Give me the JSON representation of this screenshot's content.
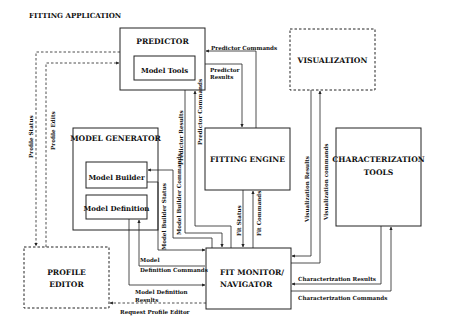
{
  "title": "FITTING APPLICATION",
  "boxes": {
    "predictor": {
      "label": "PREDICTOR",
      "style": "solid"
    },
    "model_tools": {
      "label": "Model Tools",
      "style": "solid"
    },
    "visualization": {
      "label": "VISUALIZATION",
      "style": "dashed"
    },
    "model_generator": {
      "label": "MODEL GENERATOR",
      "style": "solid"
    },
    "model_builder": {
      "label": "Model Builder",
      "style": "solid"
    },
    "model_definition": {
      "label": "Model Definition",
      "style": "solid"
    },
    "fitting_engine": {
      "label": "FITTING ENGINE",
      "style": "solid"
    },
    "characterization_tools": {
      "line1": "CHARACTERIZATION",
      "line2": "TOOLS",
      "style": "solid"
    },
    "profile_editor": {
      "line1": "PROFILE",
      "line2": "EDITOR",
      "style": "dashed"
    },
    "fit_monitor": {
      "line1": "FIT MONITOR/",
      "line2": "NAVIGATOR",
      "style": "solid"
    }
  },
  "edges": {
    "predictor_commands_h": "Predictor Commands",
    "predictor_results_h_1": "Predictor",
    "predictor_results_h_2": "Results",
    "predictor_results_v": "Predictor Results",
    "predictor_commands_v": "Predictor Commands",
    "profile_status": "Profile Status",
    "profile_edits": "Profile Edits",
    "model_builder_status": "Model Builder Status",
    "model_builder_commands": "Model Builder Commands",
    "fit_status": "Fit Status",
    "fit_commands": "Fit Commands",
    "visualization_results": "Visualization Results",
    "visualization_commands": "Visualization commands",
    "model_definition_commands_1": "Model",
    "model_definition_commands_2": "Definition Commands",
    "model_definition_results_1": "Model Definition",
    "model_definition_results_2": "Results",
    "request_profile_editor": "Request Profile Editor",
    "characterization_results": "Characterization Results",
    "characterization_commands": "Characterization Commands"
  }
}
